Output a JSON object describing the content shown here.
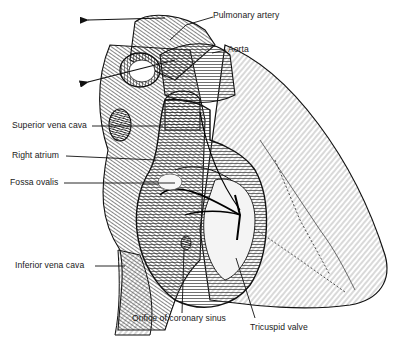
{
  "figure": {
    "labels": {
      "pulmonary_artery": "Pulmonary artery",
      "aorta": "Aorta",
      "superior_vena_cava": "Superior vena cava",
      "right_atrium": "Right atrium",
      "fossa_ovalis": "Fossa ovalis",
      "inferior_vena_cava": "Inferior vena cava",
      "orifice_coronary_sinus": "Orifice of coronary sinus",
      "tricuspid_valve": "Tricuspid valve"
    },
    "colors": {
      "ink": "#1a1a1a",
      "background": "#ffffff"
    }
  }
}
